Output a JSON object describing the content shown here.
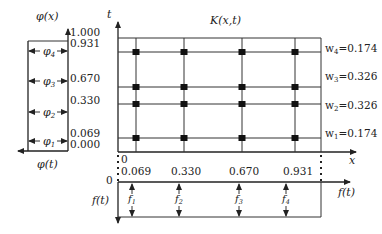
{
  "title": "K(x,t)",
  "left_panel": {
    "axis_label": "φ(x)",
    "bottom_label": "φ(t)",
    "ticks": [
      "1.000",
      "0.931",
      "0.670",
      "0.330",
      "0.069",
      "0.000"
    ],
    "segments": [
      {
        "sub": "4",
        "name": "φ"
      },
      {
        "sub": "3",
        "name": "φ"
      },
      {
        "sub": "2",
        "name": "φ"
      },
      {
        "sub": "1",
        "name": "φ"
      }
    ]
  },
  "main_panel": {
    "t_axis_label": "t",
    "x_axis_label": "x",
    "x_origin_label": "0",
    "x_ticks": [
      "0.069",
      "0.330",
      "0.670",
      "0.931"
    ],
    "weights": [
      {
        "label": "w",
        "sub": "4",
        "value": "=0.174"
      },
      {
        "label": "w",
        "sub": "3",
        "value": "=0.326"
      },
      {
        "label": "w",
        "sub": "2",
        "value": "=0.326"
      },
      {
        "label": "w",
        "sub": "1",
        "value": "=0.174"
      }
    ],
    "nodes": [
      0.069,
      0.33,
      0.67,
      0.931
    ]
  },
  "bottom_panel": {
    "origin_label": "0",
    "axis_label": "f(t)",
    "side_label": "f(t)",
    "arrows": [
      {
        "name": "f",
        "sub": "1"
      },
      {
        "name": "f",
        "sub": "2"
      },
      {
        "name": "f",
        "sub": "3"
      },
      {
        "name": "f",
        "sub": "4"
      }
    ]
  }
}
